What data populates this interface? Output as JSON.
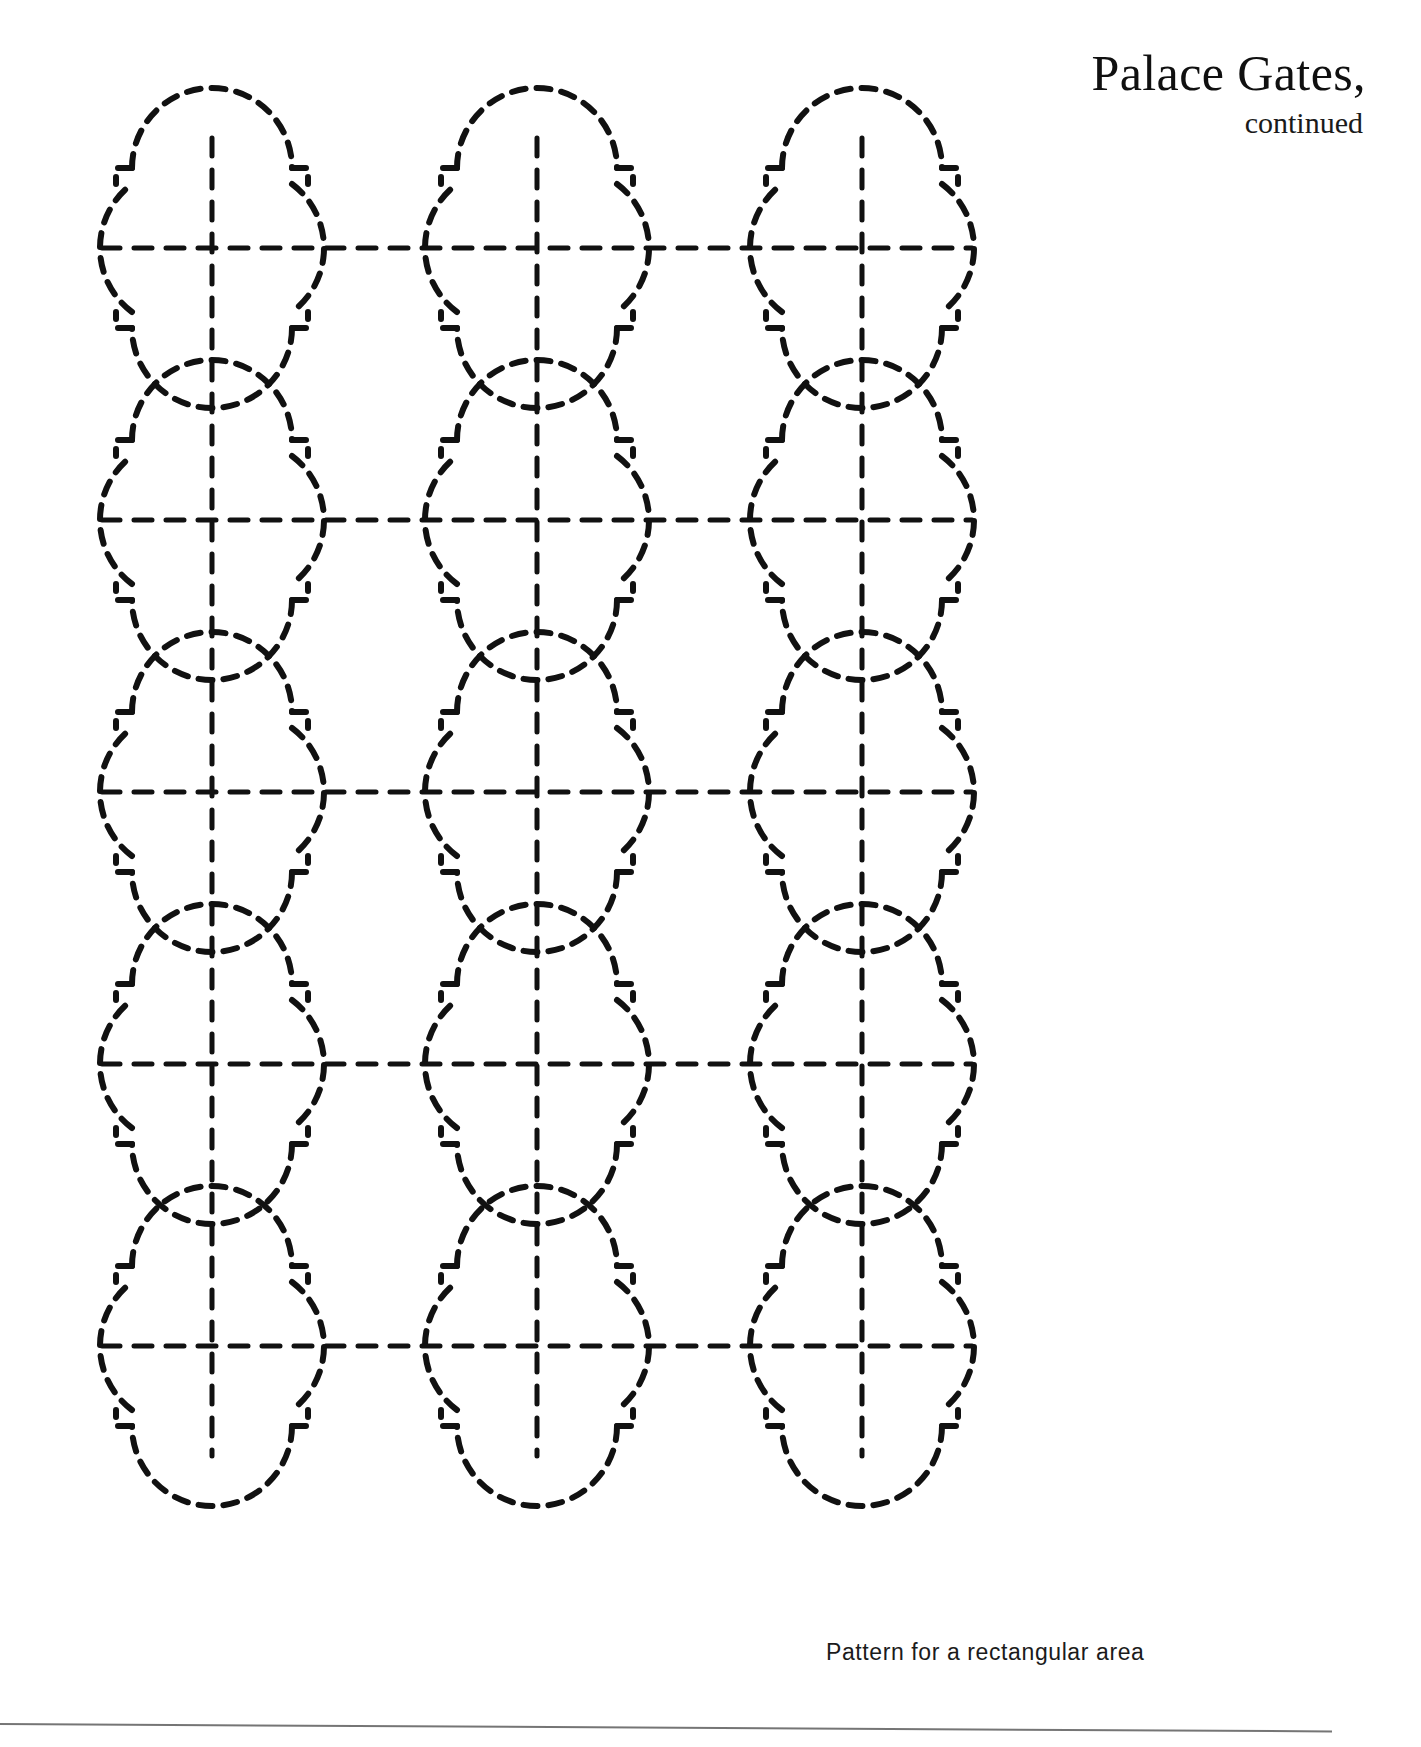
{
  "document": {
    "title": "Palace Gates,",
    "subtitle": "continued",
    "caption": "Pattern for a rectangular area",
    "ink_color": "#111111",
    "paper_color": "#ffffff",
    "rule_color": "#5d5d5d"
  },
  "pattern": {
    "name": "palace-gates-quatrefoil",
    "motif": "quatrefoil",
    "line_style": "dashed",
    "columns": 3,
    "rows": 5,
    "column_centers_px": [
      212,
      537,
      862
    ],
    "row_centers_px": [
      248,
      520,
      792,
      1064,
      1346
    ],
    "lobe_radius_px": 80,
    "notch_size_px": 16,
    "dash_pattern": "14 11",
    "stroke_width_px": 6,
    "axis_dash_pattern": "18 14",
    "axis_stroke_width_px": 5,
    "description": "Grid of dashed quatrefoil motifs with notched diagonal steps and crosshair center guide lines"
  },
  "chart_data": {
    "type": "table",
    "title": "Palace Gates, continued",
    "xlabel": "",
    "ylabel": "",
    "categories": [
      "column 1",
      "column 2",
      "column 3"
    ],
    "series": [
      {
        "name": "row 1",
        "values": [
          1,
          1,
          1
        ]
      },
      {
        "name": "row 2",
        "values": [
          1,
          1,
          1
        ]
      },
      {
        "name": "row 3",
        "values": [
          1,
          1,
          1
        ]
      },
      {
        "name": "row 4",
        "values": [
          1,
          1,
          1
        ]
      },
      {
        "name": "row 5",
        "values": [
          1,
          1,
          1
        ]
      }
    ]
  }
}
